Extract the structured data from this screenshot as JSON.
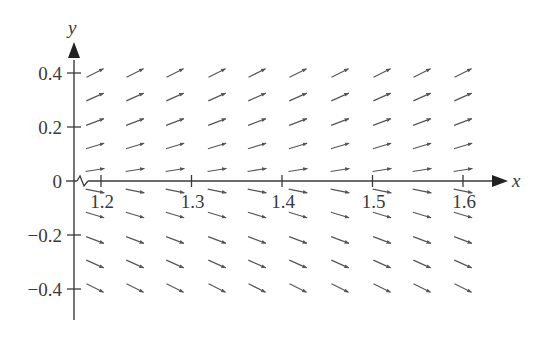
{
  "chart_data": {
    "type": "slope-field",
    "title": "",
    "xlabel": "x",
    "ylabel": "y",
    "x_axis_break": true,
    "xlim": [
      1.15,
      1.64
    ],
    "ylim": [
      -0.5,
      0.5
    ],
    "x_ticks": [
      {
        "value": 1.2,
        "label": "1.2"
      },
      {
        "value": 1.3,
        "label": "1.3"
      },
      {
        "value": 1.4,
        "label": "1.4"
      },
      {
        "value": 1.5,
        "label": "1.5"
      },
      {
        "value": 1.6,
        "label": "1.6"
      }
    ],
    "y_ticks": [
      {
        "value": 0.4,
        "label": "0.4"
      },
      {
        "value": 0.2,
        "label": "0.2"
      },
      {
        "value": 0,
        "label": "0"
      },
      {
        "value": -0.2,
        "label": "−0.2"
      },
      {
        "value": -0.4,
        "label": "−0.4"
      }
    ],
    "grid": false,
    "legend": null,
    "field": {
      "x_values": [
        1.195,
        1.24,
        1.284,
        1.33,
        1.374,
        1.419,
        1.465,
        1.511,
        1.555,
        1.6
      ],
      "y_values": [
        0.4,
        0.311,
        0.222,
        0.133,
        0.044,
        -0.044,
        -0.133,
        -0.222,
        -0.311,
        -0.4
      ],
      "row_angles_deg": [
        -27,
        -24,
        -21,
        -17,
        -9,
        11,
        17,
        21,
        24,
        27
      ],
      "note": "arrow direction depends on y only; positive y rises, negative y falls"
    }
  },
  "colors": {
    "axis": "#3a3a3a",
    "arrow": "#555555",
    "background": "#ffffff"
  }
}
